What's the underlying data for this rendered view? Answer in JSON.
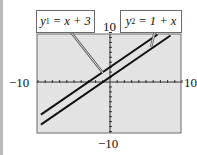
{
  "chart_data": {
    "type": "line",
    "title": "",
    "xlabel": "",
    "ylabel": "",
    "xlim": [
      -10,
      10
    ],
    "ylim": [
      -10,
      10
    ],
    "x_tick_step": 1,
    "y_tick_step": 1,
    "grid": false,
    "tick_labels": {
      "xmin": "−10",
      "xmax": "10",
      "ymin": "−10",
      "ymax": "10"
    },
    "series": [
      {
        "name": "y1 = x + 3",
        "equation": "y = x + 3",
        "x": [
          -9.6,
          6.6
        ],
        "y": [
          -6.6,
          9.6
        ]
      },
      {
        "name": "y2 = 1 + x",
        "equation": "y = 1 + x",
        "x": [
          -9.6,
          8.4
        ],
        "y": [
          -8.6,
          9.4
        ]
      }
    ],
    "annotations": [
      {
        "text": "y1 = x + 3",
        "target_series": 0
      },
      {
        "text": "y2 = 1 + x",
        "target_series": 1
      }
    ],
    "colors": {
      "plot_background": "#e3e3e3",
      "line": "#111111",
      "frame": "#6a6a6a"
    }
  },
  "labels": {
    "y1_var": "y",
    "y1_sub": "1",
    "y1_rest": " = x + 3",
    "y2_var": "y",
    "y2_sub": "2",
    "y2_rest": " = 1 + x",
    "xmin": "−10",
    "xmax": "10",
    "ymin": "−10",
    "ymax": "10"
  }
}
